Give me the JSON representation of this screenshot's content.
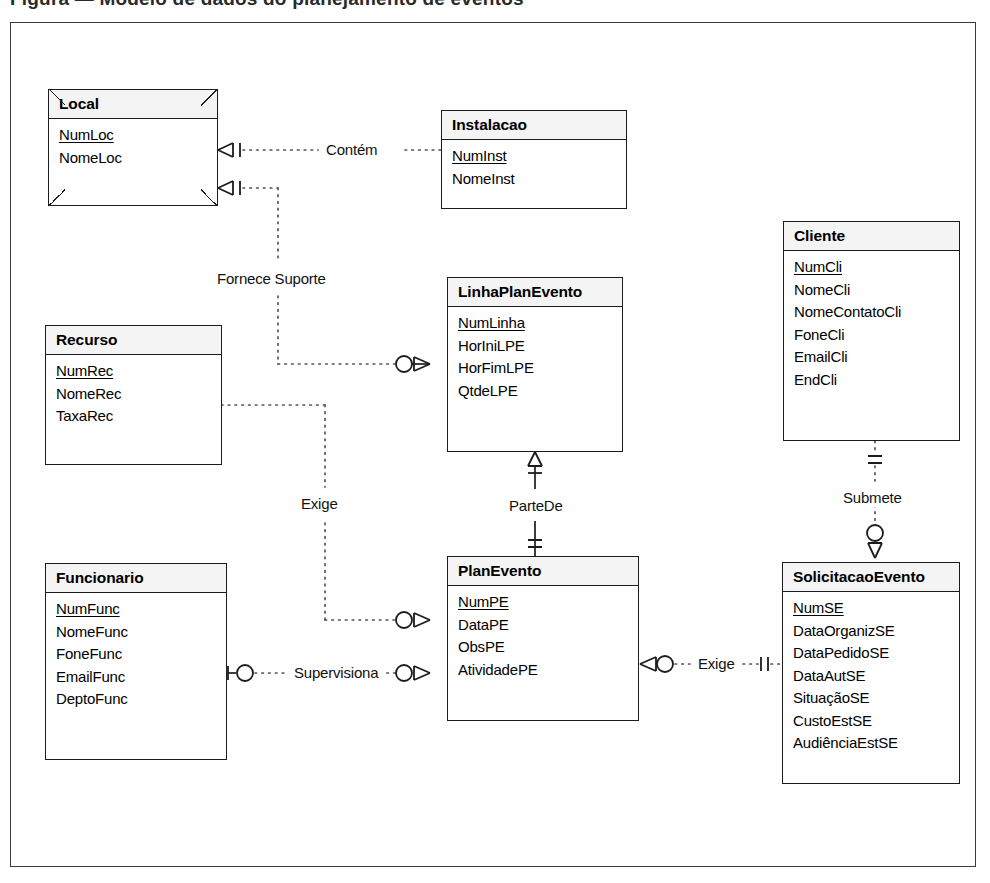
{
  "page": {
    "top_caption_fragment": "Figura — Modelo de dados do planejamento de eventos",
    "diagram_title": "Diagrama Entidade-Relacionamento",
    "notation": "crows-foot",
    "colors": {
      "line": "#1c1c1c",
      "header_fill": "#f4f4f4",
      "frame": "#3a3a3a",
      "background": "#ffffff"
    }
  },
  "entities": [
    {
      "id": "local",
      "name": "Local",
      "style": "chamfered",
      "attributes": [
        {
          "label": "NumLoc",
          "pk": true
        },
        {
          "label": "NomeLoc",
          "pk": false
        }
      ]
    },
    {
      "id": "instalacao",
      "name": "Instalacao",
      "style": "plain",
      "attributes": [
        {
          "label": "NumInst",
          "pk": true
        },
        {
          "label": "NomeInst",
          "pk": false
        }
      ]
    },
    {
      "id": "cliente",
      "name": "Cliente",
      "style": "plain",
      "attributes": [
        {
          "label": "NumCli",
          "pk": true
        },
        {
          "label": "NomeCli",
          "pk": false
        },
        {
          "label": "NomeContatoCli",
          "pk": false
        },
        {
          "label": "FoneCli",
          "pk": false
        },
        {
          "label": "EmailCli",
          "pk": false
        },
        {
          "label": "EndCli",
          "pk": false
        }
      ]
    },
    {
      "id": "recurso",
      "name": "Recurso",
      "style": "plain",
      "attributes": [
        {
          "label": "NumRec",
          "pk": true
        },
        {
          "label": "NomeRec",
          "pk": false
        },
        {
          "label": "TaxaRec",
          "pk": false
        }
      ]
    },
    {
      "id": "linhaplanevento",
      "name": "LinhaPlanEvento",
      "style": "plain",
      "attributes": [
        {
          "label": "NumLinha",
          "pk": true
        },
        {
          "label": "HorIniLPE",
          "pk": false
        },
        {
          "label": "HorFimLPE",
          "pk": false
        },
        {
          "label": "QtdeLPE",
          "pk": false
        }
      ]
    },
    {
      "id": "funcionario",
      "name": "Funcionario",
      "style": "plain",
      "attributes": [
        {
          "label": "NumFunc",
          "pk": true
        },
        {
          "label": "NomeFunc",
          "pk": false
        },
        {
          "label": "FoneFunc",
          "pk": false
        },
        {
          "label": "EmailFunc",
          "pk": false
        },
        {
          "label": "DeptoFunc",
          "pk": false
        }
      ]
    },
    {
      "id": "planevento",
      "name": "PlanEvento",
      "style": "plain",
      "attributes": [
        {
          "label": "NumPE",
          "pk": true
        },
        {
          "label": "DataPE",
          "pk": false
        },
        {
          "label": "ObsPE",
          "pk": false
        },
        {
          "label": "AtividadePE",
          "pk": false
        }
      ]
    },
    {
      "id": "solicitacaoevento",
      "name": "SolicitacaoEvento",
      "style": "plain",
      "attributes": [
        {
          "label": "NumSE",
          "pk": true
        },
        {
          "label": "DataOrganizSE",
          "pk": false
        },
        {
          "label": "DataPedidoSE",
          "pk": false
        },
        {
          "label": "DataAutSE",
          "pk": false
        },
        {
          "label": "SituaçãoSE",
          "pk": false
        },
        {
          "label": "CustoEstSE",
          "pk": false
        },
        {
          "label": "AudiênciaEstSE",
          "pk": false
        }
      ]
    }
  ],
  "relationships": [
    {
      "id": "contem",
      "label": "Contém",
      "from": "local",
      "to": "instalacao",
      "line": "dotted",
      "from_cardinality": "one-or-many",
      "to_cardinality": "exactly-one"
    },
    {
      "id": "fornece-suporte",
      "label": "Fornece Suporte",
      "from": "local",
      "to": "linhaplanevento",
      "line": "dotted",
      "from_cardinality": "one-or-many",
      "to_cardinality": "zero-or-many"
    },
    {
      "id": "exige-recurso",
      "label": "Exige",
      "from": "recurso",
      "to": "planevento",
      "line": "dotted",
      "from_cardinality": "exactly-one",
      "to_cardinality": "zero-or-many"
    },
    {
      "id": "partede",
      "label": "ParteDe",
      "from": "linhaplanevento",
      "to": "planevento",
      "line": "solid",
      "from_cardinality": "one-or-many",
      "to_cardinality": "exactly-one"
    },
    {
      "id": "supervisiona",
      "label": "Supervisiona",
      "from": "funcionario",
      "to": "planevento",
      "line": "dotted",
      "from_cardinality": "zero-or-one",
      "to_cardinality": "zero-or-many"
    },
    {
      "id": "exige-solicitacao",
      "label": "Exige",
      "from": "planevento",
      "to": "solicitacaoevento",
      "line": "dotted",
      "from_cardinality": "zero-or-many",
      "to_cardinality": "exactly-one"
    },
    {
      "id": "submete",
      "label": "Submete",
      "from": "cliente",
      "to": "solicitacaoevento",
      "line": "dotted",
      "from_cardinality": "exactly-one",
      "to_cardinality": "zero-or-many"
    }
  ]
}
